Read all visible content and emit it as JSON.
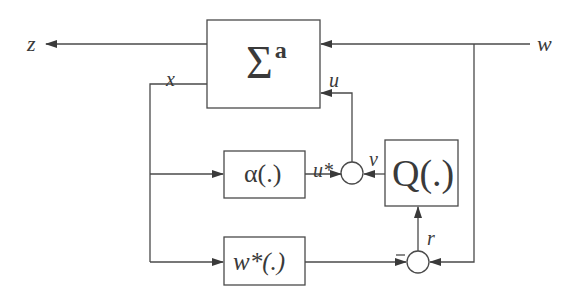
{
  "diagram": {
    "type": "block-diagram",
    "colors": {
      "line": "#4a4a4a",
      "text": "#3a3a3a",
      "background": "#ffffff"
    },
    "blocks": {
      "plant": {
        "symbol": "Σ",
        "superscript": "a"
      },
      "alpha": {
        "label": "α(.)"
      },
      "q": {
        "label": "Q(.)"
      },
      "wstar": {
        "label": "w*(.)"
      }
    },
    "signals": {
      "z": "z",
      "w": "w",
      "x": "x",
      "u": "u",
      "ustar": "u*",
      "v": "v",
      "r": "r"
    },
    "junctions": [
      {
        "name": "sum-u",
        "inputs": [
          "u*",
          "v"
        ],
        "output": "u"
      },
      {
        "name": "sum-r",
        "inputs": [
          "w*(x) (−)",
          "w"
        ],
        "output": "r"
      }
    ],
    "signs": {
      "minus": "−"
    }
  }
}
